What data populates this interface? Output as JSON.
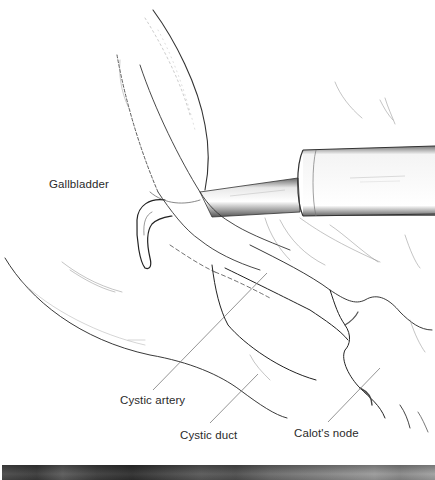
{
  "figure": {
    "type": "surgical-illustration",
    "labels": {
      "gallbladder": "Gallbladder",
      "cystic_artery": "Cystic artery",
      "cystic_duct": "Cystic duct",
      "calots_node": "Calot's node"
    },
    "colors": {
      "ink": "#2a2a2a",
      "leader_line": "#7a7a7a",
      "background": "#ffffff",
      "photo_strip": "#4a4a4a"
    }
  }
}
